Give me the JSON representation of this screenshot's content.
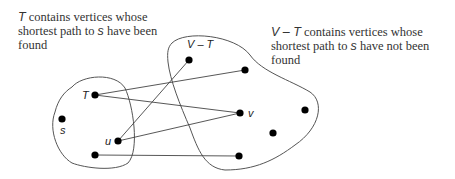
{
  "captions": {
    "left": {
      "var": "T",
      "text": " contains vertices whose shortest path to ",
      "var2": "s",
      "text2": " have been found"
    },
    "right": {
      "var": "V – T",
      "text": " contains vertices whose shortest path to ",
      "var2": "s",
      "text2": " have not been found"
    }
  },
  "labels": {
    "T_vertex": "T",
    "s_vertex": "s",
    "u_vertex": "u",
    "v_vertex": "v",
    "VT_set": "V – T"
  }
}
